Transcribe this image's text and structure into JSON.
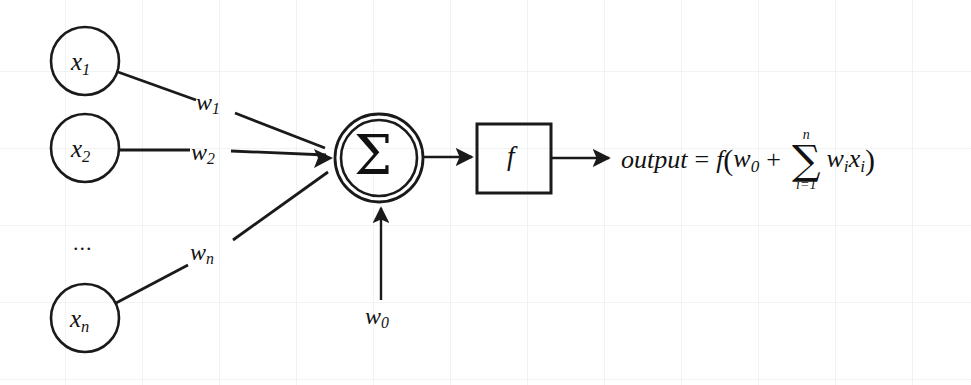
{
  "diagram": {
    "stroke_color": "#1a1a1a",
    "background_color": "#ffffff",
    "grid_color": "#cdd2d7",
    "inputs": [
      {
        "id": "x1",
        "base": "x",
        "sub": "1"
      },
      {
        "id": "x2",
        "base": "x",
        "sub": "2"
      },
      {
        "id": "xn",
        "base": "x",
        "sub": "n"
      }
    ],
    "ellipsis": "...",
    "weights": [
      {
        "id": "w1",
        "base": "w",
        "sub": "1"
      },
      {
        "id": "w2",
        "base": "w",
        "sub": "2"
      },
      {
        "id": "wn",
        "base": "w",
        "sub": "n"
      }
    ],
    "bias": {
      "id": "w0",
      "base": "w",
      "sub": "0"
    },
    "sum_node": {
      "glyph": "Σ",
      "name": "summation"
    },
    "activation_box": {
      "label": "f",
      "name": "activation-function"
    },
    "formula": {
      "output_word": "output",
      "equals": "=",
      "f": "f",
      "open_paren": "(",
      "bias_base": "w",
      "bias_sub": "0",
      "plus": "+",
      "sigma": "∑",
      "upper_limit": "n",
      "lower_limit": "i=1",
      "weight_base": "w",
      "weight_sub": "i",
      "input_base": "x",
      "input_sub": "i",
      "close_paren": ")"
    }
  }
}
